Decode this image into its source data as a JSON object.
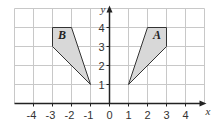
{
  "diagram": {
    "type": "coordinate-grid",
    "x_range": [
      -5,
      5
    ],
    "y_range": [
      -0.3,
      5
    ],
    "x_label": "x",
    "y_label": "y",
    "x_ticks": [
      "-4",
      "-3",
      "-2",
      "-1",
      "0",
      "1",
      "2",
      "3",
      "4"
    ],
    "y_ticks": [
      "1",
      "2",
      "3",
      "4"
    ],
    "shapes": [
      {
        "label": "A",
        "vertices": [
          [
            1,
            1
          ],
          [
            2,
            4
          ],
          [
            3,
            4
          ],
          [
            3,
            3
          ]
        ],
        "fill": "#d8d8d8"
      },
      {
        "label": "B",
        "vertices": [
          [
            -1,
            1
          ],
          [
            -2,
            4
          ],
          [
            -3,
            4
          ],
          [
            -3,
            3
          ]
        ],
        "fill": "#d8d8d8"
      }
    ],
    "colors": {
      "grid": "#c8c8c8",
      "axis": "#222222",
      "outline": "#333333"
    }
  }
}
